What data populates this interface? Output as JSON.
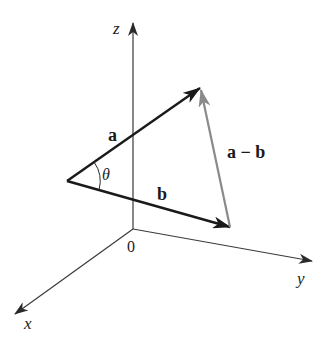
{
  "figure": {
    "type": "3d-vector-diagram",
    "background": "#ffffff",
    "axes": {
      "color": "#3a3a3a",
      "origin": {
        "x": 133,
        "y": 229
      },
      "origin_label": "0",
      "z": {
        "label": "z",
        "tip": {
          "x": 133,
          "y": 22
        }
      },
      "y": {
        "label": "y",
        "tip": {
          "x": 313,
          "y": 261
        }
      },
      "x": {
        "label": "x",
        "tip": {
          "x": 14,
          "y": 315
        }
      }
    },
    "vectors": [
      {
        "name": "a",
        "label": "a",
        "color": "#1a1a1a",
        "from": {
          "x": 67,
          "y": 181
        },
        "to": {
          "x": 200,
          "y": 88
        }
      },
      {
        "name": "b",
        "label": "b",
        "color": "#1a1a1a",
        "from": {
          "x": 67,
          "y": 181
        },
        "to": {
          "x": 230,
          "y": 227
        }
      },
      {
        "name": "a-minus-b",
        "label": "a − b",
        "color": "#8a8a8a",
        "from": {
          "x": 230,
          "y": 227
        },
        "to": {
          "x": 201,
          "y": 90
        }
      }
    ],
    "angle": {
      "label": "θ",
      "vertex": {
        "x": 67,
        "y": 181
      },
      "between": [
        "a",
        "b"
      ]
    }
  }
}
